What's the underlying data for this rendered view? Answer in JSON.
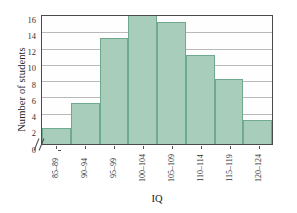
{
  "chart_data": {
    "type": "bar",
    "title": "",
    "xlabel": "IQ",
    "ylabel": "Number of students",
    "categories": [
      "85–89",
      "90–94",
      "95–99",
      "100–104",
      "105–109",
      "110–114",
      "115–119",
      "120–124"
    ],
    "values": [
      2,
      5,
      13,
      16,
      15,
      11,
      8,
      3
    ],
    "ylim": [
      0,
      16
    ],
    "ytick_labels": [
      "0",
      "2",
      "4",
      "6",
      "8",
      "10",
      "12",
      "14",
      "16"
    ],
    "ytick_values": [
      0,
      2,
      4,
      6,
      8,
      10,
      12,
      14,
      16
    ],
    "grid": true,
    "legend": false,
    "bar_color": "#a9cdbb",
    "bar_edge_color": "#6fa98e",
    "grid_color": "#b9b9b9",
    "axis_color": "#4a4a4a",
    "axis_break": "//"
  }
}
